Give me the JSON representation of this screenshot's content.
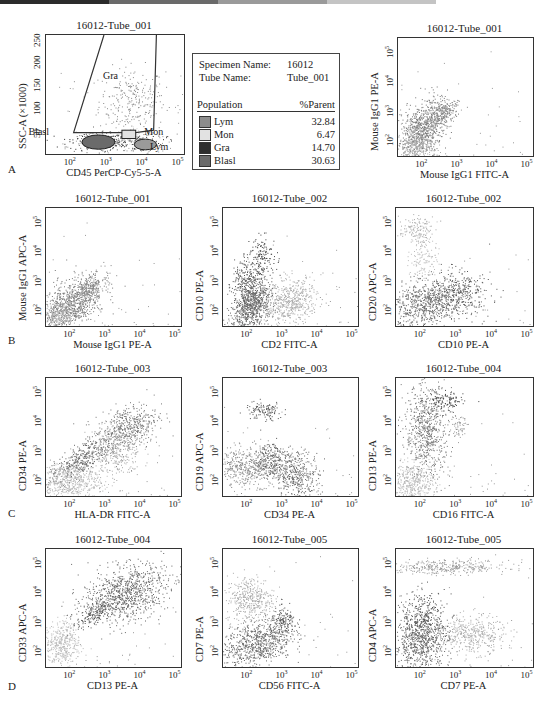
{
  "page_header": {
    "text": "第三章  临床血液学检验典型案例分析  126",
    "bar_colors": [
      "#2b2b2b",
      "#6a6a6a",
      "#9a9a9a",
      "#c4c4c4",
      "#dcdcdc"
    ]
  },
  "rows": [
    "A",
    "B",
    "C",
    "D"
  ],
  "legend": {
    "specimen_label": "Specimen Name:",
    "specimen_value": "16012",
    "tube_label": "Tube Name:",
    "tube_value": "Tube_001",
    "col_population": "Population",
    "col_parent": "%Parent",
    "items": [
      {
        "name": "Lym",
        "value": "32.84",
        "color": "#8c8c8c"
      },
      {
        "name": "Mon",
        "value": "6.47",
        "color": "#e2e2e2"
      },
      {
        "name": "Gra",
        "value": "14.70",
        "color": "#2e2e2e"
      },
      {
        "name": "Blasl",
        "value": "30.63",
        "color": "#6b6b6b"
      }
    ]
  },
  "chart_data": [
    {
      "type": "scatter",
      "row": "A",
      "title": "16012-Tube_001",
      "xlabel": "CD45 PerCP-Cy5-5-A",
      "ylabel": "SSC-A (×1000)",
      "x_scale": "log",
      "x_ticks": [
        "10^2",
        "10^3",
        "10^4",
        "10^5"
      ],
      "y_scale": "linear",
      "y_ticks": [
        "50",
        "100",
        "150",
        "200",
        "250"
      ],
      "ylim": [
        0,
        260
      ],
      "gates": [
        "Gra",
        "Blasl",
        "Mon",
        "Lym"
      ],
      "populations": [
        {
          "name": "Gra",
          "x_center_log": 3.8,
          "y_center": 100,
          "shade": "#7a7a7a"
        },
        {
          "name": "Blasl",
          "x_center_log": 2.9,
          "y_center": 25,
          "shade": "#6b6b6b"
        },
        {
          "name": "Mon",
          "x_center_log": 3.6,
          "y_center": 35,
          "shade": "#e2e2e2"
        },
        {
          "name": "Lym",
          "x_center_log": 4.0,
          "y_center": 15,
          "shade": "#8c8c8c"
        }
      ]
    },
    {
      "type": "table",
      "title": "Population statistics",
      "columns": [
        "Population",
        "%Parent"
      ],
      "rows": [
        [
          "Lym",
          32.84
        ],
        [
          "Mon",
          6.47
        ],
        [
          "Gra",
          14.7
        ],
        [
          "Blasl",
          30.63
        ]
      ]
    },
    {
      "type": "scatter",
      "row": "A",
      "title": "16012-Tube_001",
      "xlabel": "Mouse IgG1 FITC-A",
      "ylabel": "Mouse IgG1 PE-A",
      "x_scale": "log",
      "y_scale": "log",
      "x_ticks": [
        "10^2",
        "10^3",
        "10^4",
        "10^5"
      ],
      "y_ticks": [
        "10^2",
        "10^3",
        "10^4",
        "10^5"
      ],
      "description": "diagonal isotype control cloud, low-left to ~10^3.5"
    },
    {
      "type": "scatter",
      "row": "B",
      "title": "16012-Tube_001",
      "xlabel": "Mouse IgG1 PE-A",
      "ylabel": "Mouse IgG1 APC-A",
      "x_scale": "log",
      "y_scale": "log",
      "x_ticks": [
        "10^2",
        "10^3",
        "10^4",
        "10^5"
      ],
      "y_ticks": [
        "10^2",
        "10^3",
        "10^4",
        "10^5"
      ],
      "description": "isotype control cloud low-left"
    },
    {
      "type": "scatter",
      "row": "B",
      "title": "16012-Tube_002",
      "xlabel": "CD2 FITC-A",
      "ylabel": "CD10 PE-A",
      "x_scale": "log",
      "y_scale": "log",
      "x_ticks": [
        "10^2",
        "10^3",
        "10^4",
        "10^5"
      ],
      "y_ticks": [
        "10^2",
        "10^3",
        "10^4",
        "10^5"
      ],
      "description": "dark diagonal population CD2-; light CD2+ population"
    },
    {
      "type": "scatter",
      "row": "B",
      "title": "16012-Tube_002",
      "xlabel": "CD10 PE-A",
      "ylabel": "CD20 APC-A",
      "x_scale": "log",
      "y_scale": "log",
      "x_ticks": [
        "10^2",
        "10^3",
        "10^4",
        "10^5"
      ],
      "y_ticks": [
        "10^2",
        "10^3",
        "10^4",
        "10^5"
      ],
      "description": "small CD20+ light cluster top-left; main cloud low"
    },
    {
      "type": "scatter",
      "row": "C",
      "title": "16012-Tube_003",
      "xlabel": "HLA-DR FITC-A",
      "ylabel": "CD34 PE-A",
      "x_scale": "log",
      "y_scale": "log",
      "x_ticks": [
        "10^2",
        "10^3",
        "10^4",
        "10^5"
      ],
      "y_ticks": [
        "10^2",
        "10^3",
        "10^4",
        "10^5"
      ],
      "description": "diagonal CD34+HLA-DR+ population"
    },
    {
      "type": "scatter",
      "row": "C",
      "title": "16012-Tube_003",
      "xlabel": "CD34 PE-A",
      "ylabel": "CD19 APC-A",
      "x_scale": "log",
      "y_scale": "log",
      "x_ticks": [
        "10^2",
        "10^3",
        "10^4",
        "10^5"
      ],
      "y_ticks": [
        "10^2",
        "10^3",
        "10^4",
        "10^5"
      ],
      "description": "small CD19+ cluster near 10^4; main CD19- cloud"
    },
    {
      "type": "scatter",
      "row": "C",
      "title": "16012-Tube_004",
      "xlabel": "CD16 FITC-A",
      "ylabel": "CD13 PE-A",
      "x_scale": "log",
      "y_scale": "log",
      "x_ticks": [
        "10^2",
        "10^3",
        "10^4",
        "10^5"
      ],
      "y_ticks": [
        "10^2",
        "10^3",
        "10^4",
        "10^5"
      ],
      "description": "CD13+ CD16- vertical population"
    },
    {
      "type": "scatter",
      "row": "D",
      "title": "16012-Tube_004",
      "xlabel": "CD13 PE-A",
      "ylabel": "CD33 APC-A",
      "x_scale": "log",
      "y_scale": "log",
      "x_ticks": [
        "10^2",
        "10^3",
        "10^4",
        "10^5"
      ],
      "y_ticks": [
        "10^2",
        "10^3",
        "10^4",
        "10^5"
      ],
      "description": "large CD13+CD33+ cloud"
    },
    {
      "type": "scatter",
      "row": "D",
      "title": "16012-Tube_005",
      "xlabel": "CD56 FITC-A",
      "ylabel": "CD7 PE-A",
      "x_scale": "log",
      "y_scale": "log",
      "x_ticks": [
        "10^2",
        "10^3",
        "10^4",
        "10^5"
      ],
      "y_ticks": [
        "10^2",
        "10^3",
        "10^4",
        "10^5"
      ],
      "description": "light CD7+ cluster; dark main population lower"
    },
    {
      "type": "scatter",
      "row": "D",
      "title": "16012-Tube_005",
      "xlabel": "CD7 PE-A",
      "ylabel": "CD4 APC-A",
      "x_scale": "log",
      "y_scale": "log",
      "x_ticks": [
        "10^2",
        "10^3",
        "10^4",
        "10^5"
      ],
      "y_ticks": [
        "10^2",
        "10^3",
        "10^4",
        "10^5"
      ],
      "description": "CD4+ horizontal band top; CD7+ CD4- band; dark main cloud"
    }
  ]
}
